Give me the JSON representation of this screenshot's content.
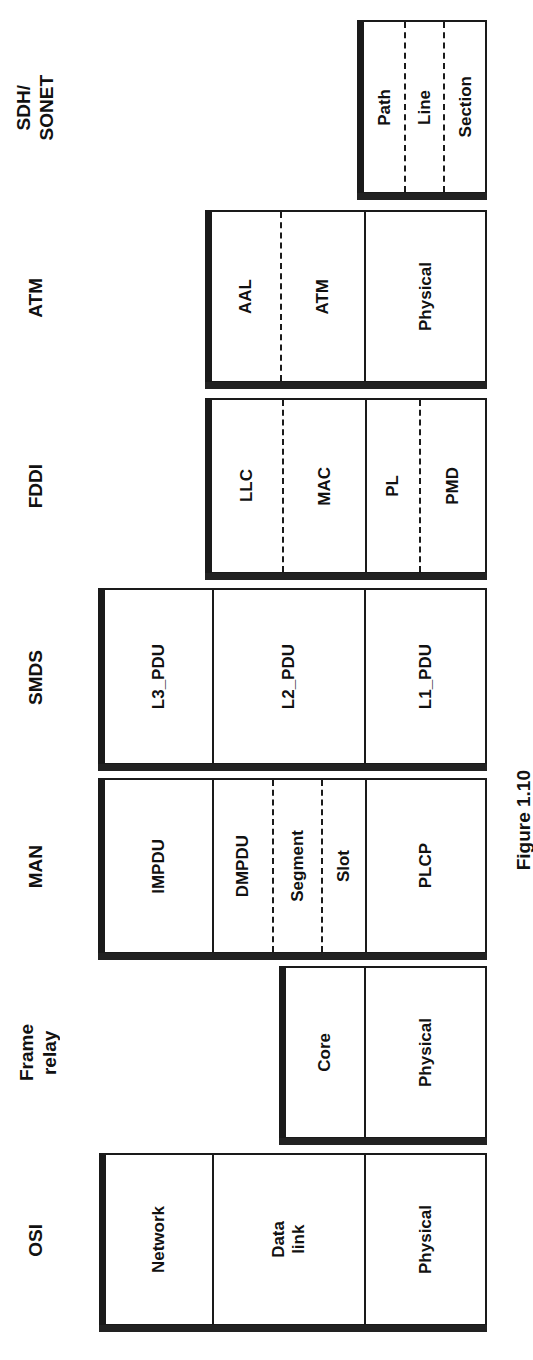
{
  "figure": {
    "caption": "Figure 1.10"
  },
  "columns": [
    {
      "id": "osi",
      "label": "OSI",
      "layers": [
        {
          "label": "Network"
        },
        {
          "label": "Data\nlink"
        },
        {
          "label": "Physical"
        }
      ]
    },
    {
      "id": "frame-relay",
      "label": "Frame\nrelay",
      "layers": [
        {
          "label": "Core"
        },
        {
          "label": "Physical"
        }
      ]
    },
    {
      "id": "man",
      "label": "MAN",
      "layers": [
        {
          "label": "IMPDU"
        },
        {
          "label": "DMPDU"
        },
        {
          "label": "Segment"
        },
        {
          "label": "Slot"
        },
        {
          "label": "PLCP"
        }
      ]
    },
    {
      "id": "smds",
      "label": "SMDS",
      "layers": [
        {
          "label": "L3_PDU"
        },
        {
          "label": "L2_PDU"
        },
        {
          "label": "L1_PDU"
        }
      ]
    },
    {
      "id": "fddi",
      "label": "FDDI",
      "layers": [
        {
          "label": "LLC"
        },
        {
          "label": "MAC"
        },
        {
          "label": "PL"
        },
        {
          "label": "PMD"
        }
      ]
    },
    {
      "id": "atm",
      "label": "ATM",
      "layers": [
        {
          "label": "AAL"
        },
        {
          "label": "ATM"
        },
        {
          "label": "Physical"
        }
      ]
    },
    {
      "id": "sdh-sonet",
      "label": "SDH/\nSONET",
      "layers": [
        {
          "label": "Path"
        },
        {
          "label": "Line"
        },
        {
          "label": "Section"
        }
      ]
    }
  ]
}
